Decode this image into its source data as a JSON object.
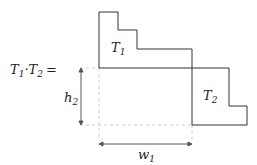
{
  "equation": {
    "lhs": "T",
    "lhs_sub1": "1",
    "dot": "·",
    "rhs": "T",
    "rhs_sub2": "2",
    "equals": "="
  },
  "labels": {
    "t1": "T",
    "t1_sub": "1",
    "t2": "T",
    "t2_sub": "2",
    "h": "h",
    "h_sub": "2",
    "w": "w",
    "w_sub": "1"
  },
  "colors": {
    "outline": "#333333",
    "dashed": "#cccccc",
    "arrow": "#555555"
  }
}
